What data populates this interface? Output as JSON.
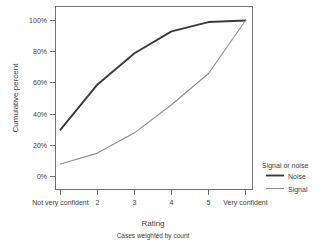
{
  "top_partial_title": "",
  "chart_data": {
    "type": "line",
    "title": "",
    "xlabel": "Rating",
    "xsublabel": "Cases weighted by count",
    "ylabel": "Cumulative percent",
    "categories": [
      "Not very confident",
      "2",
      "3",
      "4",
      "5",
      "Very confident"
    ],
    "ytick_labels": [
      "0%",
      "20%",
      "40%",
      "60%",
      "80%",
      "100%"
    ],
    "ytick_values": [
      0,
      20,
      40,
      60,
      80,
      100
    ],
    "ylim": [
      -4,
      104
    ],
    "grid": false,
    "legend_position": "right",
    "legend_title": "Signal or noise",
    "series": [
      {
        "name": "Noise",
        "color": "#3a3a3a",
        "values": [
          30,
          59,
          79,
          93,
          99,
          100
        ]
      },
      {
        "name": "Signal",
        "color": "#8d8d8d",
        "values": [
          8,
          15,
          28,
          46,
          66,
          100
        ]
      }
    ]
  },
  "legend": {
    "title": "Signal or noise",
    "entries": [
      {
        "label": "Noise",
        "color": "#3a3a3a"
      },
      {
        "label": "Signal",
        "color": "#8d8d8d"
      }
    ]
  }
}
